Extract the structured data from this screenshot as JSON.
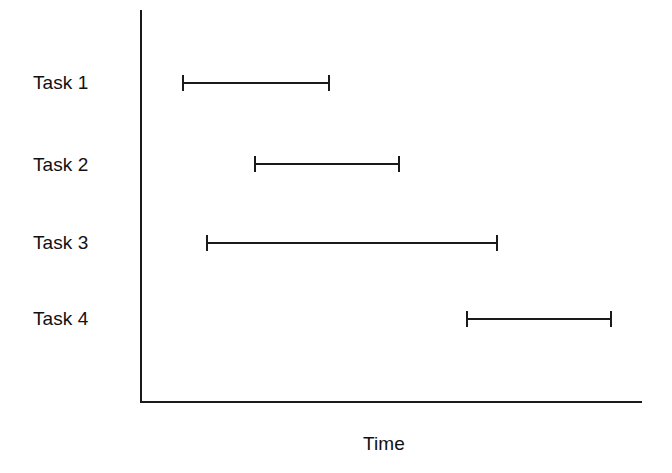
{
  "chart_data": {
    "type": "bar",
    "chart_kind": "gantt",
    "title": "",
    "subtitle": "",
    "xlabel": "Time",
    "ylabel": "",
    "grid": false,
    "legend": null,
    "axis_color": "#1a1a1a",
    "bar_color": "#1a1a1a",
    "background_color": "#ffffff",
    "categories": [
      "Task 1",
      "Task 2",
      "Task 3",
      "Task 4"
    ],
    "xlim": [
      0,
      100
    ],
    "xticks": [],
    "xticklabels": [],
    "series": [
      {
        "name": "Task duration",
        "values": [
          29.5,
          29.1,
          58.2,
          29.1
        ]
      }
    ],
    "tasks": [
      {
        "label": "Task 1",
        "start": 8.4,
        "end": 37.8,
        "duration": 29.5
      },
      {
        "label": "Task 2",
        "start": 22.7,
        "end": 51.8,
        "duration": 29.1
      },
      {
        "label": "Task 3",
        "start": 13.1,
        "end": 71.3,
        "duration": 58.2
      },
      {
        "label": "Task 4",
        "start": 64.9,
        "end": 94.0,
        "duration": 29.1
      }
    ]
  },
  "axes": {
    "y_axis": {
      "x": 140,
      "top": 10,
      "bottom": 403
    },
    "x_axis": {
      "y": 401,
      "left": 140,
      "right": 642
    }
  },
  "labels": {
    "task_rows": [
      {
        "text": "Task 1",
        "x": 33,
        "y": 73
      },
      {
        "text": "Task 2",
        "x": 33,
        "y": 155
      },
      {
        "text": "Task 3",
        "x": 33,
        "y": 233
      },
      {
        "text": "Task 4",
        "x": 33,
        "y": 309
      }
    ],
    "x_axis_title": {
      "text": "Time",
      "x": 363,
      "y": 434
    }
  },
  "bars": [
    {
      "name": "Task 1",
      "x": 182,
      "width": 148,
      "y": 74
    },
    {
      "name": "Task 2",
      "x": 254,
      "width": 146,
      "y": 155
    },
    {
      "name": "Task 3",
      "x": 206,
      "width": 292,
      "y": 234
    },
    {
      "name": "Task 4",
      "x": 466,
      "width": 146,
      "y": 310
    }
  ]
}
